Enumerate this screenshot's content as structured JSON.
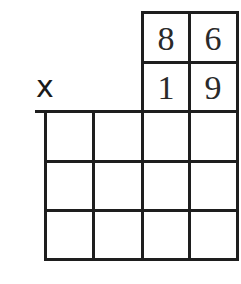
{
  "operator": "x",
  "multiplicand": {
    "tens": "8",
    "ones": "6"
  },
  "multiplier": {
    "tens": "1",
    "ones": "9"
  },
  "answer_grid": {
    "rows": 3,
    "cols": 4,
    "cells": [
      [
        "",
        "",
        "",
        ""
      ],
      [
        "",
        "",
        "",
        ""
      ],
      [
        "",
        "",
        "",
        ""
      ]
    ]
  },
  "colors": {
    "line": "#1e1e1e",
    "background": "#ffffff"
  }
}
